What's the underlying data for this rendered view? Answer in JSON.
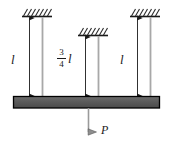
{
  "figure": {
    "type": "engineering-mechanics-diagram",
    "colors": {
      "line": "#1a1a1a",
      "rod": "#a8a8a8",
      "beam_fill": "#5b5b5b",
      "beam_stroke": "#000000",
      "hatch": "#2b2b2b",
      "background": "#ffffff"
    },
    "supports": [
      {
        "name": "left-support",
        "x": 22,
        "y": 16,
        "width": 30
      },
      {
        "name": "middle-support",
        "x": 78,
        "y": 35,
        "width": 30
      },
      {
        "name": "right-support",
        "x": 130,
        "y": 16,
        "width": 30
      }
    ],
    "rods": [
      {
        "name": "left-rod",
        "x": 42,
        "top": 18,
        "bottom": 97
      },
      {
        "name": "middle-rod",
        "x": 98,
        "top": 37,
        "bottom": 97
      },
      {
        "name": "right-rod",
        "x": 150,
        "top": 18,
        "bottom": 97
      }
    ],
    "dimensions": [
      {
        "name": "left-dimension",
        "x": 29,
        "top": 18,
        "bottom": 96,
        "label": "l",
        "label_kind": "plain"
      },
      {
        "name": "middle-dimension",
        "x": 85,
        "top": 37,
        "bottom": 96,
        "label": "3/4 l",
        "label_kind": "fraction",
        "numerator": "3",
        "denominator": "4",
        "symbol": "l"
      },
      {
        "name": "right-dimension",
        "x": 137,
        "top": 18,
        "bottom": 96,
        "label": "l",
        "label_kind": "plain"
      }
    ],
    "beam": {
      "name": "beam",
      "x": 13,
      "y": 96,
      "width": 147,
      "height": 12
    },
    "load": {
      "name": "load-arrow",
      "x": 88,
      "top": 108,
      "bottom": 133,
      "label": "P"
    }
  },
  "labels": {
    "left_length": "l",
    "right_length": "l",
    "fraction_numerator": "3",
    "fraction_denominator": "4",
    "fraction_symbol": "l",
    "load": "P"
  }
}
